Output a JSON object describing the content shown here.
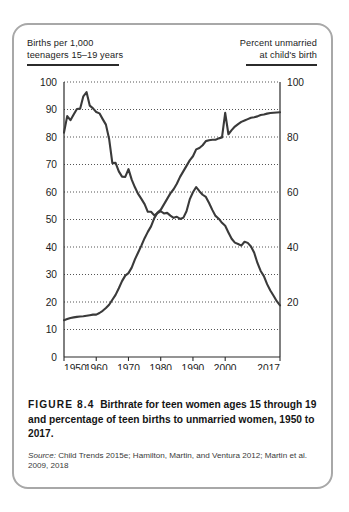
{
  "figure": {
    "left_axis_title_line1": "Births per 1,000",
    "left_axis_title_line2": "teenagers 15–19 years",
    "right_axis_title_line1": "Percent unmarried",
    "right_axis_title_line2": "at child's birth",
    "figure_number": "FIGURE 8.4",
    "caption": "Birthrate for teen women ages 15 through 19 and percentage of teen births to unmarried women, 1950 to 2017.",
    "source_label": "Source:",
    "source_text": "Child Trends 2015e; Hamilton, Martin, and Ventura 2012; Martin et al. 2009, 2018"
  },
  "chart_data": {
    "type": "line",
    "title": "Birthrate for teen women ages 15 through 19 and percentage of teen births to unmarried women, 1950 to 2017",
    "xlabel": "",
    "ylabel": "Births per 1,000 teenagers 15–19 years",
    "y2label": "Percent unmarried at child's birth",
    "xlim": [
      1950,
      2017
    ],
    "ylim": [
      0,
      100
    ],
    "y2lim": [
      0,
      100
    ],
    "yticks": [
      0,
      10,
      20,
      30,
      40,
      50,
      60,
      70,
      80,
      90,
      100
    ],
    "y2ticks": [
      20,
      40,
      60,
      80,
      100
    ],
    "xticks": [
      1950,
      1960,
      1970,
      1980,
      1990,
      2000,
      2017
    ],
    "xticklabels": [
      "1950",
      "1960",
      "1970",
      "1980",
      "1990",
      "2000",
      "2017"
    ],
    "grid": "horizontal-dotted",
    "legend": "none",
    "line_color": "#3a3a3a",
    "series": [
      {
        "name": "Births per 1,000 teenagers 15-19 years",
        "axis": "left",
        "x": [
          1950,
          1951,
          1952,
          1953,
          1954,
          1955,
          1956,
          1957,
          1958,
          1959,
          1960,
          1961,
          1962,
          1963,
          1964,
          1965,
          1966,
          1967,
          1968,
          1969,
          1970,
          1971,
          1972,
          1973,
          1974,
          1975,
          1976,
          1977,
          1978,
          1979,
          1980,
          1981,
          1982,
          1983,
          1984,
          1985,
          1986,
          1987,
          1988,
          1989,
          1990,
          1991,
          1992,
          1993,
          1994,
          1995,
          1996,
          1997,
          1998,
          1999,
          2000,
          2001,
          2002,
          2003,
          2004,
          2005,
          2006,
          2007,
          2008,
          2009,
          2010,
          2011,
          2012,
          2013,
          2014,
          2015,
          2016,
          2017
        ],
        "values": [
          81.6,
          87.6,
          86.1,
          88.2,
          90.2,
          90.3,
          94.8,
          96.3,
          91.4,
          90.4,
          89.1,
          88.6,
          86.5,
          84.5,
          79.3,
          70.5,
          70.6,
          67.5,
          65.6,
          65.5,
          68.3,
          64.5,
          61.7,
          59.3,
          57.5,
          55.6,
          52.8,
          52.8,
          51.5,
          52.3,
          53.0,
          52.2,
          52.4,
          51.4,
          50.6,
          51.0,
          50.2,
          50.6,
          53.0,
          57.3,
          59.9,
          61.8,
          60.3,
          59.0,
          58.2,
          56.0,
          53.5,
          51.3,
          50.3,
          48.8,
          47.7,
          45.3,
          43.0,
          41.6,
          41.1,
          40.5,
          41.9,
          41.5,
          40.2,
          37.9,
          34.2,
          31.3,
          29.4,
          26.5,
          24.2,
          22.3,
          20.3,
          18.8
        ]
      },
      {
        "name": "Percent unmarried at child's birth",
        "axis": "right",
        "x": [
          1950,
          1951,
          1952,
          1953,
          1954,
          1955,
          1956,
          1957,
          1958,
          1959,
          1960,
          1961,
          1962,
          1963,
          1964,
          1965,
          1966,
          1967,
          1968,
          1969,
          1970,
          1971,
          1972,
          1973,
          1974,
          1975,
          1976,
          1977,
          1978,
          1979,
          1980,
          1981,
          1982,
          1983,
          1984,
          1985,
          1986,
          1987,
          1988,
          1989,
          1990,
          1991,
          1992,
          1993,
          1994,
          1995,
          1996,
          1997,
          1998,
          1999,
          2000,
          2001,
          2002,
          2003,
          2004,
          2005,
          2006,
          2007,
          2008,
          2009,
          2010,
          2011,
          2012,
          2013,
          2014,
          2015,
          2016,
          2017
        ],
        "values": [
          13.4,
          13.8,
          14.2,
          14.4,
          14.6,
          14.7,
          14.8,
          15.0,
          15.2,
          15.4,
          15.4,
          16.0,
          16.8,
          17.8,
          19.0,
          20.8,
          22.6,
          25.0,
          27.6,
          29.6,
          30.5,
          32.5,
          35.5,
          38.0,
          40.5,
          43.2,
          45.5,
          47.5,
          50.5,
          52.5,
          53.5,
          55.5,
          57.5,
          59.5,
          61.0,
          63.0,
          65.5,
          67.5,
          69.5,
          71.5,
          73.0,
          75.5,
          76.0,
          77.0,
          78.5,
          78.8,
          79.0,
          79.0,
          79.5,
          79.8,
          88.8,
          81.0,
          82.5,
          83.8,
          84.7,
          85.5,
          86.0,
          86.5,
          87.0,
          87.2,
          87.5,
          88.0,
          88.2,
          88.5,
          88.7,
          88.8,
          88.9,
          89.0
        ]
      }
    ]
  }
}
